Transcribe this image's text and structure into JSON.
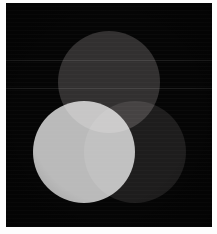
{
  "image": {
    "title": "Additive color mixing — three overlapping light discs",
    "width": 217,
    "height": 234,
    "background_color": "#050505",
    "border_color": "#fdfdfd",
    "rendering": "grayscale photograph of projected light circles on a dark screen"
  },
  "frame": {
    "name": "photo-border",
    "left_width": 6,
    "top_width": 3,
    "right_width": 5,
    "bottom_width": 7,
    "color": "#fdfdfd"
  },
  "plate": {
    "name": "dark-plate",
    "x": 6,
    "y": 3,
    "width": 206,
    "height": 224,
    "color": "#050505"
  },
  "discs": [
    {
      "id": "top",
      "label": "Upper disc",
      "center_x": 109,
      "center_y": 82,
      "radius": 51,
      "color": "#2e2c2c",
      "brightness": "dim gray",
      "blend": "screen"
    },
    {
      "id": "left",
      "label": "Lower-left disc",
      "center_x": 84,
      "center_y": 152,
      "radius": 51,
      "color": "#b9b9b9",
      "brightness": "bright light gray",
      "blend": "screen"
    },
    {
      "id": "right",
      "label": "Lower-right disc",
      "center_x": 135,
      "center_y": 152,
      "radius": 51,
      "color": "#191818",
      "brightness": "very dark gray",
      "blend": "screen"
    }
  ],
  "overlaps": [
    {
      "id": "top-left",
      "label": "Upper + lower-left overlap",
      "color": "#d8d6d6",
      "description": "bright crescent at upper area of the left disc"
    },
    {
      "id": "left-right",
      "label": "Lower-left + lower-right overlap",
      "color": "#cbcbcb",
      "description": "vertical lens-shaped band between the two lower discs"
    },
    {
      "id": "top-right",
      "label": "Upper + lower-right overlap",
      "color": "#3c3a3a",
      "description": "dim wedge where the upper and right discs meet"
    },
    {
      "id": "center",
      "label": "Triple overlap",
      "color": "#f6f6f6",
      "description": "brightest near-white region where all three discs coincide"
    }
  ],
  "artifacts": {
    "scanlines": "faint horizontal banding across the plate",
    "bands": [
      {
        "id": "band-a",
        "y": 60
      },
      {
        "id": "band-b",
        "y": 88
      }
    ],
    "vignette": "slight darkening toward the plate corners"
  }
}
